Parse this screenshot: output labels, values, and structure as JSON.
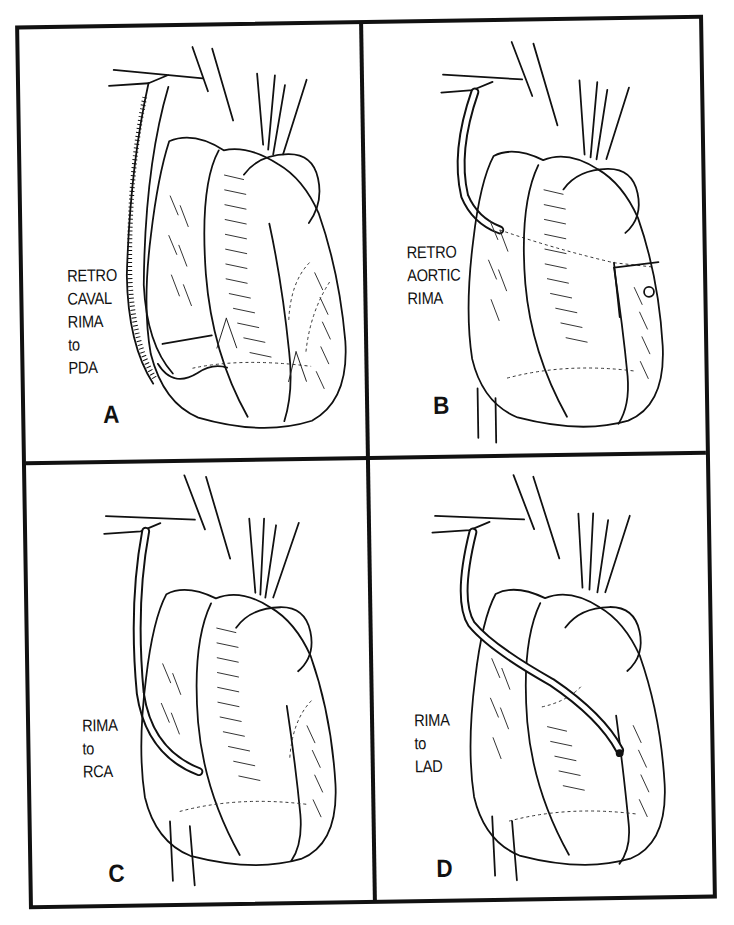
{
  "figure": {
    "panels": [
      {
        "id": "A",
        "letter": "A",
        "caption_lines": [
          "RETRO",
          "CAVAL",
          "RIMA",
          "to",
          "PDA"
        ],
        "graft_route": "retrocaval"
      },
      {
        "id": "B",
        "letter": "B",
        "caption_lines": [
          "RETRO",
          "AORTIC",
          "RIMA"
        ],
        "graft_route": "retroaortic"
      },
      {
        "id": "C",
        "letter": "C",
        "caption_lines": [
          "RIMA",
          "to",
          "RCA"
        ],
        "graft_route": "rca"
      },
      {
        "id": "D",
        "letter": "D",
        "caption_lines": [
          "RIMA",
          "to",
          "LAD"
        ],
        "graft_route": "lad"
      }
    ],
    "colors": {
      "ink": "#111111",
      "background": "#ffffff"
    }
  }
}
